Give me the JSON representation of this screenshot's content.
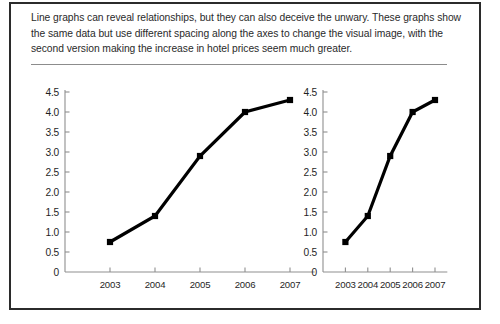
{
  "figure": {
    "caption": "Line graphs can reveal relationships, but they can also deceive the unwary. These graphs show the same data but use different spacing along the axes to change the visual image, with the second version making the increase in hotel prices seem much greater.",
    "border_color": "#2b2b2b",
    "divider_color": "#8c8c8c",
    "background": "#ffffff"
  },
  "chart_data": [
    {
      "type": "line",
      "name": "wide-spacing-version",
      "title": "",
      "xlabel": "",
      "ylabel": "",
      "x": [
        "2003",
        "2004",
        "2005",
        "2006",
        "2007"
      ],
      "categories": [
        "2003",
        "2004",
        "2005",
        "2006",
        "2007"
      ],
      "values": [
        0.75,
        1.4,
        2.9,
        4.0,
        4.3
      ],
      "ylim": [
        0,
        4.5
      ],
      "yticks": [
        "0",
        "0.5",
        "1.0",
        "1.5",
        "2.0",
        "2.5",
        "3.0",
        "3.5",
        "4.0",
        "4.5"
      ],
      "ytick_values": [
        0,
        0.5,
        1.0,
        1.5,
        2.0,
        2.5,
        3.0,
        3.5,
        4.0,
        4.5
      ],
      "grid": false,
      "legend": "none",
      "line_color": "#000000",
      "marker": "square"
    },
    {
      "type": "line",
      "name": "compressed-spacing-version",
      "title": "",
      "xlabel": "",
      "ylabel": "",
      "x": [
        "2003",
        "2004",
        "2005",
        "2006",
        "2007"
      ],
      "categories": [
        "2003",
        "2004",
        "2005",
        "2006",
        "2007"
      ],
      "values": [
        0.75,
        1.4,
        2.9,
        4.0,
        4.3
      ],
      "ylim": [
        0,
        4.5
      ],
      "yticks": [
        "0",
        "0.5",
        "1.0",
        "1.5",
        "2.0",
        "2.5",
        "3.0",
        "3.5",
        "4.0",
        "4.5"
      ],
      "ytick_values": [
        0,
        0.5,
        1.0,
        1.5,
        2.0,
        2.5,
        3.0,
        3.5,
        4.0,
        4.5
      ],
      "grid": false,
      "legend": "none",
      "line_color": "#000000",
      "marker": "square"
    }
  ]
}
